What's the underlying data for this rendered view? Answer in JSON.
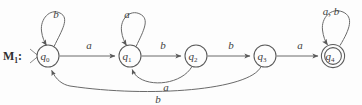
{
  "figure": {
    "machine_name": "M",
    "machine_subscript": "1",
    "machine_colon": ":",
    "alphabet": [
      "a",
      "b"
    ],
    "background_color": "#fdfdfd",
    "stroke_color": "#6a6a6a",
    "text_color": "#3b3b3b"
  },
  "states": [
    {
      "id": "q0",
      "label": "q",
      "subscript": "0",
      "x": 48,
      "y": 56,
      "r": 11,
      "accepting": false,
      "start": true
    },
    {
      "id": "q1",
      "label": "q",
      "subscript": "1",
      "x": 130,
      "y": 56,
      "r": 11,
      "accepting": false,
      "start": false
    },
    {
      "id": "q2",
      "label": "q",
      "subscript": "2",
      "x": 196,
      "y": 56,
      "r": 11,
      "accepting": false,
      "start": false
    },
    {
      "id": "q3",
      "label": "q",
      "subscript": "3",
      "x": 265,
      "y": 56,
      "r": 11,
      "accepting": false,
      "start": false
    },
    {
      "id": "q4",
      "label": "q",
      "subscript": "4",
      "x": 333,
      "y": 56,
      "r": 11,
      "accepting": true,
      "start": false
    }
  ],
  "transitions": [
    {
      "id": "t_q0_q0",
      "from": "q0",
      "to": "q0",
      "symbol": "b",
      "kind": "self-loop",
      "label_x": 56,
      "label_y": 18
    },
    {
      "id": "t_q0_q1",
      "from": "q0",
      "to": "q1",
      "symbol": "a",
      "kind": "straight",
      "label_x": 89,
      "label_y": 49
    },
    {
      "id": "t_q1_q1",
      "from": "q1",
      "to": "q1",
      "symbol": "a",
      "kind": "self-loop",
      "label_x": 127,
      "label_y": 18
    },
    {
      "id": "t_q1_q2",
      "from": "q1",
      "to": "q2",
      "symbol": "b",
      "kind": "straight",
      "label_x": 163,
      "label_y": 49
    },
    {
      "id": "t_q2_q3",
      "from": "q2",
      "to": "q3",
      "symbol": "b",
      "kind": "straight",
      "label_x": 231,
      "label_y": 49
    },
    {
      "id": "t_q3_q4",
      "from": "q3",
      "to": "q4",
      "symbol": "a",
      "kind": "straight",
      "label_x": 300,
      "label_y": 49
    },
    {
      "id": "t_q4_q4",
      "from": "q4",
      "to": "q4",
      "symbol": "a, b",
      "kind": "self-loop",
      "label_x": 331,
      "label_y": 15
    },
    {
      "id": "t_q2_q1",
      "from": "q2",
      "to": "q1",
      "symbol": "a",
      "kind": "return-arc",
      "label_x": 166,
      "label_y": 91
    },
    {
      "id": "t_q3_q0",
      "from": "q3",
      "to": "q0",
      "symbol": "b",
      "kind": "return-arc",
      "label_x": 158,
      "label_y": 103
    }
  ]
}
